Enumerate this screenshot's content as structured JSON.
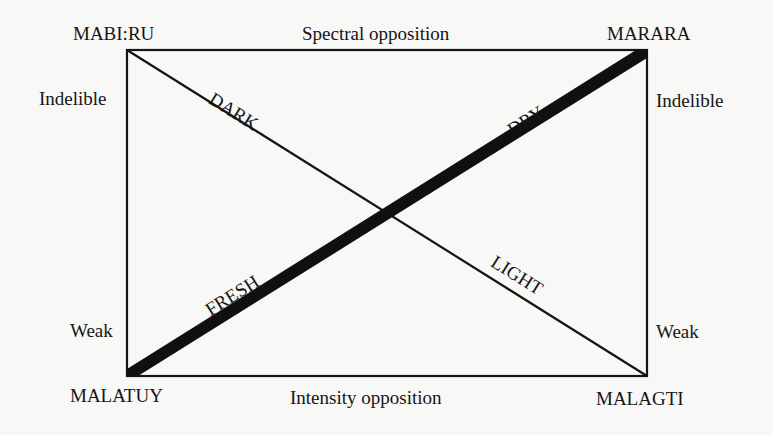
{
  "diagram": {
    "corners": {
      "top_left": "MABI:RU",
      "top_right": "MARARA",
      "bottom_left": "MALATUY",
      "bottom_right": "MALAGTI"
    },
    "edges": {
      "top": "Spectral opposition",
      "bottom": "Intensity opposition"
    },
    "side_labels": {
      "left_top": "Indelible",
      "right_top": "Indelible",
      "left_bottom": "Weak",
      "right_bottom": "Weak"
    },
    "diagonals": {
      "thin": {
        "from": "MABI:RU",
        "to": "MALAGTI",
        "upper_label": "DARK",
        "lower_label": "LIGHT",
        "stroke_width": 2
      },
      "thick": {
        "from": "MALATUY",
        "to": "MARARA",
        "lower_label": "FRESH",
        "upper_label": "DRY",
        "stroke_width": 12
      }
    },
    "colors": {
      "background": "#f8f8f6",
      "ink": "#141414"
    }
  }
}
